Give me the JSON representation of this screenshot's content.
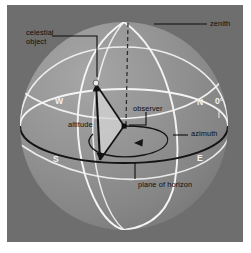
{
  "figure": {
    "kind": "astronomy-diagram",
    "colors": {
      "page_background": "#ffffff",
      "panel_background": "#6e6e6e",
      "sphere_fill_light": "#9a9a9a",
      "sphere_fill_mid": "#8a8a8a",
      "sphere_fill_dark": "#7b7b7b",
      "great_circle": "#f4f4f4",
      "horizon_ellipse": "#151515",
      "triangle_fill": "#d2d2d2",
      "label_text": "#0d0d0d",
      "cardinal_text": "#f2f2f2",
      "dashed_line": "#3b3b3b"
    }
  },
  "labels": {
    "zenith": "zenith",
    "celestial_object_line1": "celestial",
    "celestial_object_line2": "object",
    "observer": "observer",
    "altitude": "altitude",
    "azimuth": "azimuth",
    "plane_of_horizon": "plane of horizon"
  },
  "cardinals": {
    "west": "W",
    "north": "N",
    "south": "S",
    "east": "E",
    "azimuth_origin": "0°"
  },
  "geometry": {
    "sphere_center_x": 124,
    "sphere_center_y": 126,
    "sphere_radius": 104,
    "zenith_point": [
      128,
      22
    ],
    "observer_point": [
      124,
      126
    ],
    "celestial_object_point": [
      96,
      84
    ],
    "horizon_foot_point": [
      100,
      160
    ]
  }
}
